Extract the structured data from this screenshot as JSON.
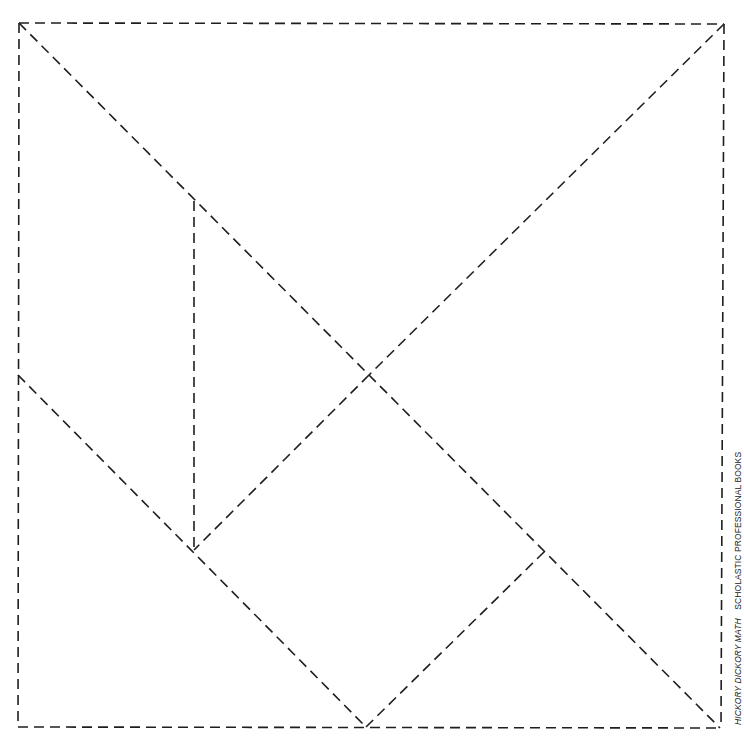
{
  "page": {
    "background": "#ffffff",
    "line_color": "#1e1e1e"
  },
  "tangram": {
    "square": {
      "top_left": [
        19,
        23
      ],
      "top_right": [
        724,
        24
      ],
      "bottom_right": [
        720,
        728
      ],
      "bottom_left": [
        18,
        727
      ]
    },
    "cut_lines": [
      {
        "name": "top-edge",
        "from": [
          19,
          23
        ],
        "to": [
          724,
          24
        ]
      },
      {
        "name": "right-edge",
        "from": [
          724,
          24
        ],
        "to": [
          721,
          728
        ]
      },
      {
        "name": "bottom-edge",
        "from": [
          18,
          727
        ],
        "to": [
          721,
          728
        ]
      },
      {
        "name": "left-edge",
        "from": [
          19,
          23
        ],
        "to": [
          18,
          727
        ]
      },
      {
        "name": "diagonal-main",
        "from": [
          19,
          23
        ],
        "to": [
          720,
          728
        ]
      },
      {
        "name": "diagonal-upper-right-to-center",
        "from": [
          724,
          24
        ],
        "to": [
          369,
          375
        ]
      },
      {
        "name": "center-to-lower-left-junction",
        "from": [
          369,
          375
        ],
        "to": [
          194,
          550
        ]
      },
      {
        "name": "vertical-inner",
        "from": [
          194,
          201
        ],
        "to": [
          194,
          550
        ]
      },
      {
        "name": "left-mid-to-bottom",
        "from": [
          18,
          375
        ],
        "to": [
          366,
          727
        ]
      },
      {
        "name": "bottom-to-right-junction",
        "from": [
          366,
          727
        ],
        "to": [
          545,
          551
        ]
      }
    ]
  },
  "credit": {
    "title": "HICKORY DICKORY MATH",
    "publisher": "SCHOLASTIC PROFESSIONAL BOOKS"
  }
}
